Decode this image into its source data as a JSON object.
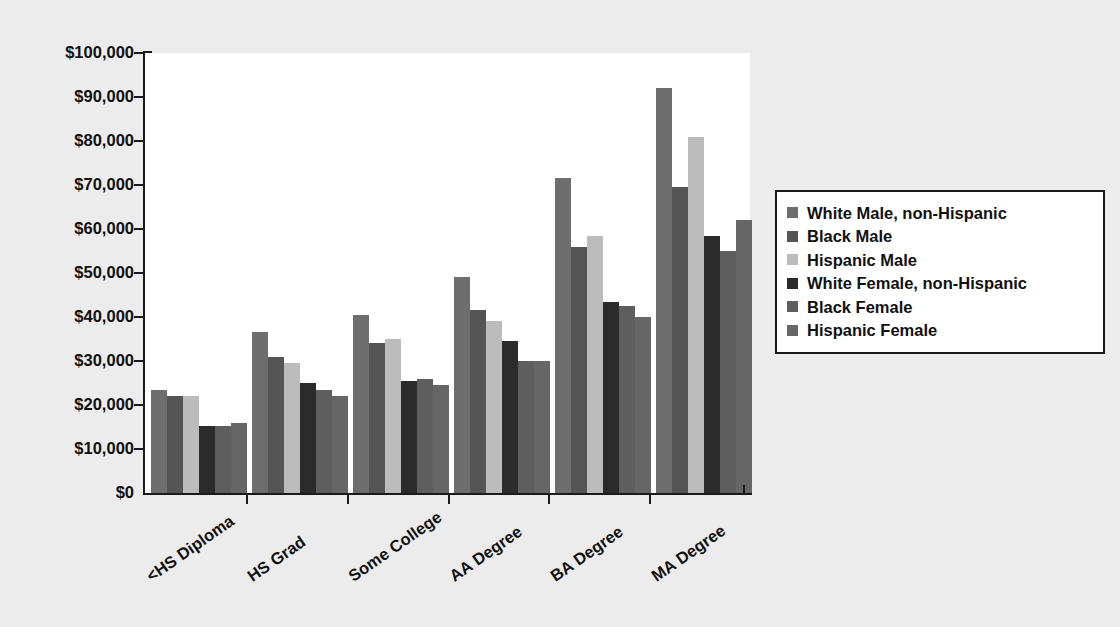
{
  "chart_data": {
    "type": "bar",
    "title": "",
    "subtitle": "",
    "xlabel": "",
    "ylabel": "",
    "grid": true,
    "legend_position": "right",
    "ylim": [
      0,
      100000
    ],
    "ytick_values": [
      0,
      10000,
      20000,
      30000,
      40000,
      50000,
      60000,
      70000,
      80000,
      90000,
      100000
    ],
    "ytick_labels": [
      "$0",
      "$10,000",
      "$20,000",
      "$30,000",
      "$40,000",
      "$50,000",
      "$60,000",
      "$70,000",
      "$80,000",
      "$90,000",
      "$100,000"
    ],
    "categories": [
      "<HS Diploma",
      "HS Grad",
      "Some College",
      "AA Degree",
      "BA Degree",
      "MA Degree"
    ],
    "series": [
      {
        "name": "White Male, non-Hispanic",
        "color": "#6e6e6e",
        "values": [
          23500,
          36500,
          40500,
          49000,
          71500,
          92000
        ]
      },
      {
        "name": "Black Male",
        "color": "#555555",
        "values": [
          22000,
          31000,
          34000,
          41500,
          56000,
          69500
        ]
      },
      {
        "name": "Hispanic Male",
        "color": "#bcbcbc",
        "values": [
          22000,
          29500,
          35000,
          39000,
          58500,
          81000
        ]
      },
      {
        "name": "White Female, non-Hispanic",
        "color": "#2b2b2b",
        "values": [
          15300,
          25000,
          25500,
          34500,
          43500,
          58500
        ]
      },
      {
        "name": "Black Female",
        "color": "#5e5e5e",
        "values": [
          15300,
          23500,
          26000,
          30000,
          42500,
          55000
        ]
      },
      {
        "name": "Hispanic Female",
        "color": "#666666",
        "values": [
          16000,
          22000,
          24500,
          30000,
          40000,
          62000
        ]
      }
    ]
  },
  "legend": {
    "entries": [
      "White Male, non-Hispanic",
      "Black Male",
      "Hispanic Male",
      "White Female, non-Hispanic",
      "Black Female",
      "Hispanic Female"
    ]
  },
  "colors": {
    "page_background": "#ececec",
    "plot_background": "#ffffff",
    "axis": "#1a1a1a",
    "gridline": "#e2e2e2",
    "text": "#111111"
  }
}
